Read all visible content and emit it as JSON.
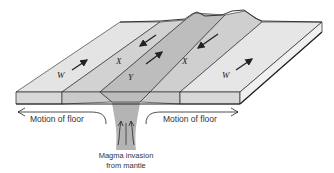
{
  "diagram": {
    "band_labels": {
      "left_outer": "W",
      "left_inner": "X",
      "center": "Y",
      "right_inner": "X",
      "right_outer": "W"
    },
    "captions": {
      "motion_left": "Motion of floor",
      "motion_right": "Motion of floor",
      "magma_line1": "Magma invasion",
      "magma_line2": "from mantle"
    },
    "colors": {
      "outer_band": "#e4e4e4",
      "inner_band": "#cfcfcf",
      "center_band": "#bdbdbd",
      "front_face": "#d6d6d6",
      "magma": "#b4b4b4",
      "outline": "#222222"
    },
    "arrows": [
      {
        "band": "left_outer W",
        "direction": "away-from-ridge (up-right on left? toward back-right)"
      },
      {
        "band": "left_inner X",
        "direction": "toward-front-left"
      },
      {
        "band": "center Y",
        "direction": "toward-back-right"
      },
      {
        "band": "right_inner X",
        "direction": "toward-front-left"
      },
      {
        "band": "right_outer W",
        "direction": "toward-back-right"
      }
    ]
  }
}
